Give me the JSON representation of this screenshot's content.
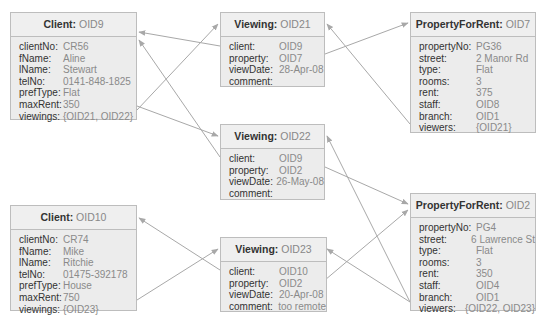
{
  "diagram": {
    "type": "object-instance-diagram",
    "colors": {
      "box_fill": "#ececec",
      "box_border": "#bdbdbd",
      "line": "#a8a8a8",
      "key_text": "#333333",
      "value_text": "#8a8a8a"
    },
    "objects": [
      {
        "id": "client-oid9",
        "class": "Client",
        "oid": "OID9",
        "attrs": [
          {
            "k": "clientNo:",
            "v": "CR56"
          },
          {
            "k": "fName:",
            "v": "Aline"
          },
          {
            "k": "lName:",
            "v": "Stewart"
          },
          {
            "k": "telNo:",
            "v": "0141-848-1825"
          },
          {
            "k": "prefType:",
            "v": "Flat"
          },
          {
            "k": "maxRent:",
            "v": "350"
          },
          {
            "k": "viewings:",
            "v": "{OID21, OID22}"
          }
        ]
      },
      {
        "id": "viewing-oid21",
        "class": "Viewing",
        "oid": "OID21",
        "attrs": [
          {
            "k": "client:",
            "v": "OID9"
          },
          {
            "k": "property:",
            "v": "OID7"
          },
          {
            "k": "viewDate:",
            "v": "28-Apr-08"
          },
          {
            "k": "comment:",
            "v": ""
          }
        ]
      },
      {
        "id": "property-oid7",
        "class": "PropertyForRent",
        "oid": "OID7",
        "attrs": [
          {
            "k": "propertyNo:",
            "v": "PG36"
          },
          {
            "k": "street:",
            "v": "2 Manor Rd"
          },
          {
            "k": "type:",
            "v": "Flat"
          },
          {
            "k": "rooms:",
            "v": "3"
          },
          {
            "k": "rent:",
            "v": "375"
          },
          {
            "k": "staff:",
            "v": "OID8"
          },
          {
            "k": "branch:",
            "v": "OID1"
          },
          {
            "k": "viewers:",
            "v": "{OID21}"
          }
        ]
      },
      {
        "id": "viewing-oid22",
        "class": "Viewing",
        "oid": "OID22",
        "attrs": [
          {
            "k": "client:",
            "v": "OID9"
          },
          {
            "k": "property:",
            "v": "OID2"
          },
          {
            "k": "viewDate:",
            "v": "26-May-08"
          },
          {
            "k": "comment:",
            "v": ""
          }
        ]
      },
      {
        "id": "client-oid10",
        "class": "Client",
        "oid": "OID10",
        "attrs": [
          {
            "k": "clientNo:",
            "v": "CR74"
          },
          {
            "k": "fName:",
            "v": "Mike"
          },
          {
            "k": "lName:",
            "v": "Ritchie"
          },
          {
            "k": "telNo:",
            "v": "01475-392178"
          },
          {
            "k": "prefType:",
            "v": "House"
          },
          {
            "k": "maxRent:",
            "v": "750"
          },
          {
            "k": "viewings:",
            "v": "{OID23}"
          }
        ]
      },
      {
        "id": "viewing-oid23",
        "class": "Viewing",
        "oid": "OID23",
        "attrs": [
          {
            "k": "client:",
            "v": "OID10"
          },
          {
            "k": "property:",
            "v": "OID2"
          },
          {
            "k": "viewDate:",
            "v": "20-Apr-08"
          },
          {
            "k": "comment:",
            "v": "too remote"
          }
        ]
      },
      {
        "id": "property-oid2",
        "class": "PropertyForRent",
        "oid": "OID2",
        "attrs": [
          {
            "k": "propertyNo:",
            "v": "PG4"
          },
          {
            "k": "street:",
            "v": "6 Lawrence St"
          },
          {
            "k": "type:",
            "v": "Flat"
          },
          {
            "k": "rooms:",
            "v": "3"
          },
          {
            "k": "rent:",
            "v": "350"
          },
          {
            "k": "staff:",
            "v": "OID4"
          },
          {
            "k": "branch:",
            "v": "OID1"
          },
          {
            "k": "viewers:",
            "v": "{OID22, OID23}"
          }
        ]
      }
    ],
    "links": [
      {
        "from": "client-oid9.viewings",
        "to": "viewing-oid21"
      },
      {
        "from": "client-oid9.viewings",
        "to": "viewing-oid22"
      },
      {
        "from": "viewing-oid21.client",
        "to": "client-oid9"
      },
      {
        "from": "viewing-oid22.client",
        "to": "client-oid9"
      },
      {
        "from": "viewing-oid21.property",
        "to": "property-oid7"
      },
      {
        "from": "property-oid7.viewers",
        "to": "viewing-oid21"
      },
      {
        "from": "viewing-oid22.property",
        "to": "property-oid2"
      },
      {
        "from": "property-oid2.viewers",
        "to": "viewing-oid22"
      },
      {
        "from": "client-oid10.viewings",
        "to": "viewing-oid23"
      },
      {
        "from": "viewing-oid23.client",
        "to": "client-oid10"
      },
      {
        "from": "viewing-oid23.property",
        "to": "property-oid2"
      },
      {
        "from": "property-oid2.viewers",
        "to": "viewing-oid23"
      }
    ]
  }
}
